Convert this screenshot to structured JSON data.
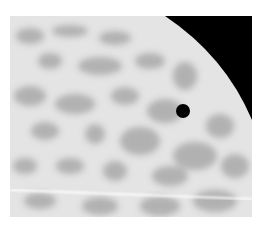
{
  "image": {
    "subject": "solar-disk-transit",
    "description": "Grayscale close-up of a mottled bright disk limb against black sky with a small dark round body silhouetted on the disk",
    "colors": {
      "background": "#ffffff",
      "sky": "#000000",
      "disk_light": "#e6e6e6",
      "disk_mottle": "#a8a8a8",
      "transit_dot": "#000000",
      "streak": "#ffffff"
    }
  }
}
